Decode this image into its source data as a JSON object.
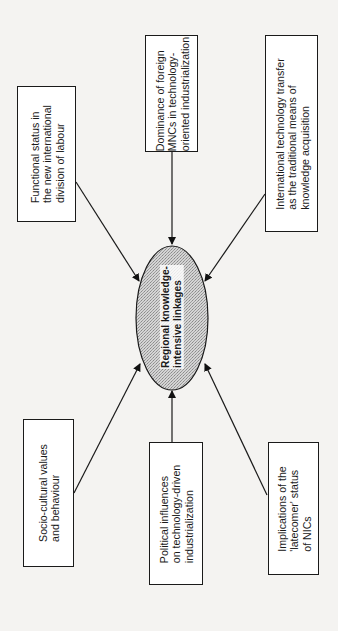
{
  "diagram": {
    "center": {
      "label": "Regional knowledge-\nintensive linkages",
      "fill": "#c8c8c8"
    },
    "factors": [
      {
        "id": "functional-status",
        "label": "Functional status in\nthe new international\ndivision of labour",
        "position": "top-left"
      },
      {
        "id": "foreign-mncs",
        "label": "Dominance of foreign\nMNCs in technology-\noriented industrialization",
        "position": "top-center"
      },
      {
        "id": "tech-transfer",
        "label": "International technology transfer\nas the traditional means of\nknowledge acquisition",
        "position": "top-right"
      },
      {
        "id": "socio-cultural",
        "label": "Socio-cultural values\nand behaviour",
        "position": "bottom-left"
      },
      {
        "id": "political-influences",
        "label": "Political influences\non technology-driven\nindustrialization",
        "position": "bottom-center"
      },
      {
        "id": "latecomer-status",
        "label": "Implications of the\n'latecomer' status\nof NICs",
        "position": "bottom-right"
      }
    ],
    "edges": [
      {
        "from": "functional-status",
        "to": "center"
      },
      {
        "from": "foreign-mncs",
        "to": "center"
      },
      {
        "from": "tech-transfer",
        "to": "center"
      },
      {
        "from": "socio-cultural",
        "to": "center"
      },
      {
        "from": "political-influences",
        "to": "center"
      },
      {
        "from": "latecomer-status",
        "to": "center"
      }
    ],
    "orientation": "rotated-90-ccw"
  }
}
